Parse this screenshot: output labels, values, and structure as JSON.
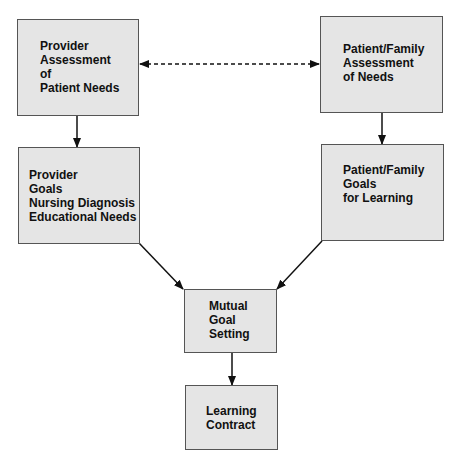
{
  "diagram": {
    "nodes": {
      "provider_assessment": {
        "lines": [
          "Provider",
          "Assessment",
          "of",
          "Patient Needs"
        ]
      },
      "patient_family_assessment": {
        "lines": [
          "Patient/Family",
          "Assessment",
          "of Needs"
        ]
      },
      "provider_goals": {
        "lines": [
          "Provider",
          "Goals",
          "Nursing Diagnosis",
          "Educational Needs"
        ]
      },
      "patient_family_goals": {
        "lines": [
          "Patient/Family",
          "Goals",
          "for Learning"
        ]
      },
      "mutual_goal_setting": {
        "lines": [
          "Mutual",
          "Goal",
          "Setting"
        ]
      },
      "learning_contract": {
        "lines": [
          "Learning",
          "Contract"
        ]
      }
    },
    "edges": [
      {
        "from": "provider_assessment",
        "to": "patient_family_assessment",
        "style": "dashed",
        "bidirectional": true
      },
      {
        "from": "provider_assessment",
        "to": "provider_goals",
        "style": "solid"
      },
      {
        "from": "patient_family_assessment",
        "to": "patient_family_goals",
        "style": "solid"
      },
      {
        "from": "provider_goals",
        "to": "mutual_goal_setting",
        "style": "solid"
      },
      {
        "from": "patient_family_goals",
        "to": "mutual_goal_setting",
        "style": "solid"
      },
      {
        "from": "mutual_goal_setting",
        "to": "learning_contract",
        "style": "solid"
      }
    ],
    "colors": {
      "box_fill": "#e5e5e5",
      "box_border": "#555555",
      "text": "#111111",
      "arrow": "#111111"
    }
  }
}
